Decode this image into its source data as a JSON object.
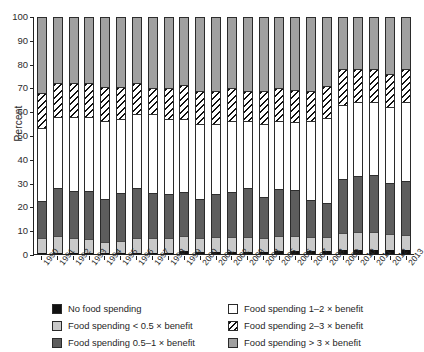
{
  "chart_data": {
    "type": "bar",
    "title": "",
    "subtitle": "",
    "xlabel": "",
    "ylabel": "Percent",
    "ylim": [
      0,
      100
    ],
    "yticks": [
      0,
      10,
      20,
      30,
      40,
      50,
      60,
      70,
      80,
      90,
      100
    ],
    "grid": false,
    "stacked": true,
    "stack_total": 100,
    "legend_position": "bottom",
    "categories": [
      "1990",
      "1991",
      "1992",
      "1993",
      "1994",
      "1995",
      "1996",
      "1997",
      "1998",
      "1999",
      "2000",
      "2001",
      "2002",
      "2003",
      "2004",
      "2005",
      "2006",
      "2007",
      "2008",
      "2009",
      "2010",
      "2011",
      "2012",
      "2013"
    ],
    "series": [
      {
        "name": "No food spending",
        "color": "#111111",
        "values": [
          0.4,
          0.4,
          0.4,
          0.4,
          0.4,
          0.4,
          0.4,
          0.4,
          0.4,
          1.2,
          1.0,
          1.0,
          1.0,
          1.0,
          1.0,
          1.2,
          1.2,
          1.2,
          1.2,
          1.6,
          1.6,
          1.6,
          1.6,
          1.6
        ]
      },
      {
        "name": "Food spending < 0.5 × benefit",
        "color": "#c9c9c9",
        "values": [
          6.3,
          7.0,
          6.2,
          6.1,
          4.6,
          5.0,
          6.3,
          6.2,
          6.2,
          6.3,
          5.8,
          6.0,
          6.1,
          6.2,
          5.8,
          6.3,
          6.2,
          5.8,
          6.0,
          7.4,
          7.6,
          7.6,
          7.0,
          6.6
        ]
      },
      {
        "name": "Food spending 0.5–1 × benefit",
        "color": "#5d5d5d",
        "values": [
          15.7,
          20.5,
          20.0,
          20.1,
          18.4,
          20.4,
          21.3,
          19.4,
          18.9,
          18.5,
          16.6,
          18.3,
          19.0,
          20.8,
          17.4,
          20.0,
          19.6,
          15.6,
          14.4,
          22.8,
          23.6,
          24.0,
          21.4,
          22.6
        ]
      },
      {
        "name": "Food spending 1–2 × benefit",
        "color": "#ffffff",
        "values": [
          30.6,
          30.1,
          31.4,
          31.4,
          32.6,
          31.2,
          31.0,
          33.4,
          31.5,
          31.0,
          31.6,
          29.7,
          29.9,
          28.0,
          30.8,
          28.5,
          28.7,
          33.4,
          36.0,
          31.2,
          31.2,
          30.8,
          32.0,
          33.2
        ]
      },
      {
        "name": "Food spending 2–3 × benefit",
        "color": "#ffffff",
        "hatch": "diagonal",
        "values": [
          15.0,
          14.0,
          14.0,
          14.0,
          14.6,
          13.4,
          13.0,
          11.0,
          13.0,
          14.2,
          14.0,
          14.0,
          14.0,
          13.0,
          14.0,
          14.2,
          13.5,
          13.0,
          13.4,
          15.0,
          14.0,
          14.0,
          14.0,
          14.0
        ]
      },
      {
        "name": "Food spending > 3 × benefit",
        "color": "#a0a0a0",
        "values": [
          32.0,
          28.0,
          28.0,
          28.0,
          29.4,
          29.6,
          28.0,
          30.0,
          30.0,
          28.8,
          31.0,
          31.0,
          30.0,
          31.0,
          31.0,
          29.8,
          30.8,
          31.0,
          29.0,
          22.0,
          22.0,
          22.0,
          24.0,
          22.0
        ]
      }
    ]
  },
  "legend": {
    "items": [
      {
        "label": "No food spending",
        "key": "s-none"
      },
      {
        "label": "Food spending < 0.5 × benefit",
        "key": "s-lt05"
      },
      {
        "label": "Food spending 0.5–1 × benefit",
        "key": "s-05to1"
      },
      {
        "label": "Food spending 1–2 × benefit",
        "key": "s-1to2"
      },
      {
        "label": "Food spending 2–3 × benefit",
        "key": "s-2to3"
      },
      {
        "label": "Food spending > 3 × benefit",
        "key": "s-gt3"
      }
    ]
  }
}
